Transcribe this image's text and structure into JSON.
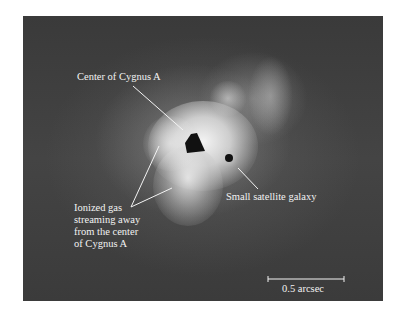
{
  "figure": {
    "subject": "Cygnus A",
    "annotations": [
      {
        "id": "center",
        "text": "Center of Cygnus A"
      },
      {
        "id": "satellite",
        "text": "Small satellite galaxy"
      },
      {
        "id": "ionized-gas",
        "lines": [
          "Ionized gas",
          "streaming away",
          "from the center",
          "of Cygnus A"
        ]
      }
    ],
    "scale_bar": {
      "label": "0.5 arcsec"
    }
  }
}
